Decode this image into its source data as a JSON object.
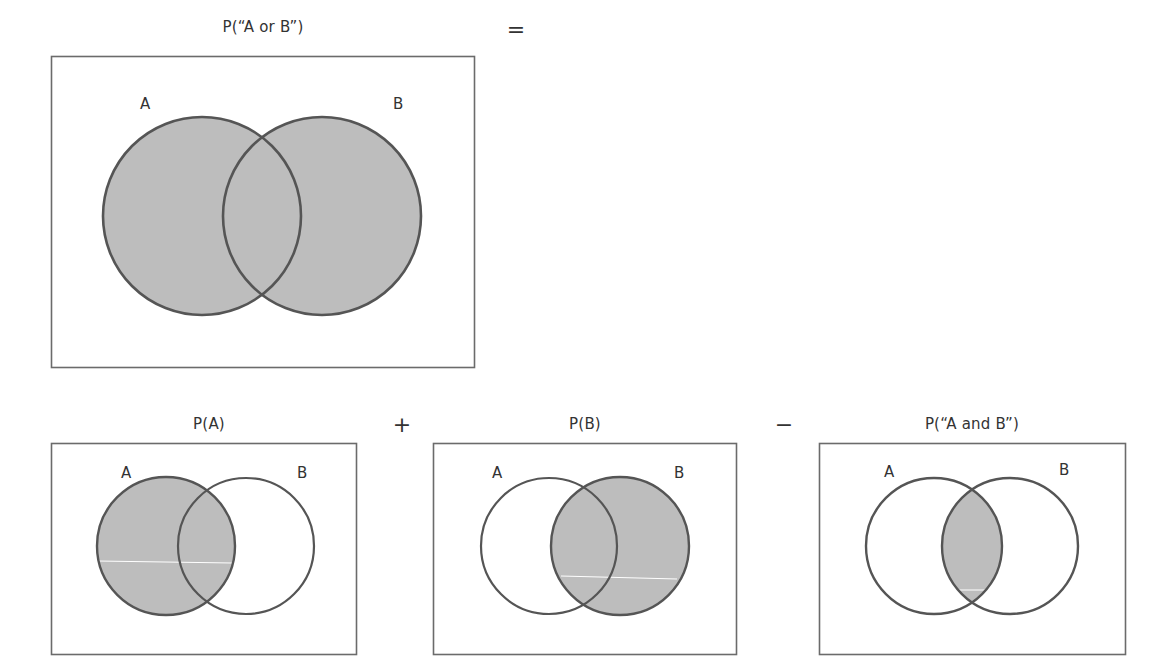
{
  "diagram": {
    "colors": {
      "shade": "#bdbdbd",
      "outline": "#555555",
      "frame": "#6b6b6b",
      "background": "#ffffff"
    },
    "equation": {
      "equals": "=",
      "plus": "+",
      "minus": "−"
    },
    "panels": [
      {
        "id": "union",
        "caption": "P(“A or B”)",
        "set_a_label": "A",
        "set_b_label": "B",
        "shaded": "A ∪ B"
      },
      {
        "id": "a",
        "caption": "P(A)",
        "set_a_label": "A",
        "set_b_label": "B",
        "shaded": "A"
      },
      {
        "id": "b",
        "caption": "P(B)",
        "set_a_label": "A",
        "set_b_label": "B",
        "shaded": "B"
      },
      {
        "id": "intersection",
        "caption": "P(“A and B”)",
        "set_a_label": "A",
        "set_b_label": "B",
        "shaded": "A ∩ B"
      }
    ]
  }
}
